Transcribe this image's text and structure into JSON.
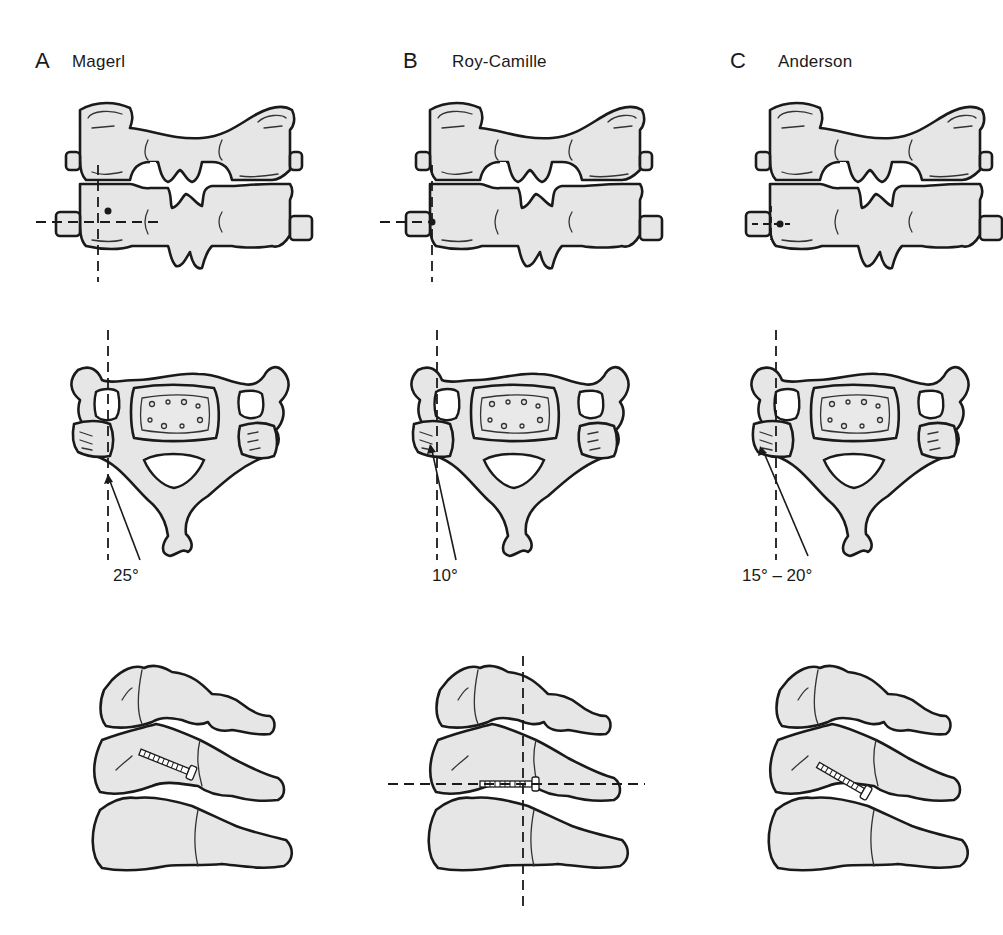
{
  "figure": {
    "columns": [
      {
        "letter": "A",
        "title": "Magerl",
        "angle_label": "25°"
      },
      {
        "letter": "B",
        "title": "Roy-Camille",
        "angle_label": "10°"
      },
      {
        "letter": "C",
        "title": "Anderson",
        "angle_label": "15° – 20°"
      }
    ],
    "rows": [
      "posterior-view",
      "axial-view",
      "lateral-view"
    ],
    "colors": {
      "bone_fill": "#e6e6e6",
      "outline": "#1a1a1a",
      "background": "#ffffff"
    }
  }
}
